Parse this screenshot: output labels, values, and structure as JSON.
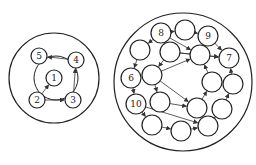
{
  "diagram": {
    "left_group": {
      "outer": {
        "cx": 54,
        "cy": 78,
        "r": 45
      },
      "ring": {
        "cx": 56,
        "cy": 78,
        "r": 22
      },
      "nodes": [
        {
          "id": "n5",
          "label": "5",
          "x": 39,
          "y": 56
        },
        {
          "id": "n4",
          "label": "4",
          "x": 76,
          "y": 60
        },
        {
          "id": "n1",
          "label": "1",
          "x": 54,
          "y": 78
        },
        {
          "id": "n2",
          "label": "2",
          "x": 37,
          "y": 100
        },
        {
          "id": "n3",
          "label": "3",
          "x": 73,
          "y": 100
        }
      ],
      "edges": [
        [
          "n4",
          "n5"
        ],
        [
          "n3",
          "n4"
        ],
        [
          "n2",
          "n3"
        ],
        [
          "n2",
          "n1"
        ]
      ]
    },
    "right_group": {
      "outer": {
        "cx": 183,
        "cy": 82,
        "r": 69
      },
      "nodes": [
        {
          "id": "r8",
          "label": "8",
          "x": 161,
          "y": 33
        },
        {
          "id": "rt",
          "label": "",
          "x": 185,
          "y": 30
        },
        {
          "id": "r9",
          "label": "9",
          "x": 208,
          "y": 36
        },
        {
          "id": "r7",
          "label": "7",
          "x": 229,
          "y": 58
        },
        {
          "id": "ra",
          "label": "",
          "x": 140,
          "y": 50
        },
        {
          "id": "rb",
          "label": "",
          "x": 170,
          "y": 52
        },
        {
          "id": "rc",
          "label": "",
          "x": 200,
          "y": 55
        },
        {
          "id": "r6",
          "label": "6",
          "x": 131,
          "y": 78
        },
        {
          "id": "rd",
          "label": "",
          "x": 152,
          "y": 75
        },
        {
          "id": "re",
          "label": "",
          "x": 212,
          "y": 82
        },
        {
          "id": "rf",
          "label": "",
          "x": 233,
          "y": 84
        },
        {
          "id": "r10",
          "label": "10",
          "x": 136,
          "y": 104
        },
        {
          "id": "rg",
          "label": "",
          "x": 160,
          "y": 102
        },
        {
          "id": "rh",
          "label": "",
          "x": 197,
          "y": 108
        },
        {
          "id": "ri",
          "label": "",
          "x": 222,
          "y": 109
        },
        {
          "id": "rj",
          "label": "",
          "x": 152,
          "y": 125
        },
        {
          "id": "rk",
          "label": "",
          "x": 181,
          "y": 131
        },
        {
          "id": "rl",
          "label": "",
          "x": 208,
          "y": 126
        }
      ],
      "edges": [
        [
          "r8",
          "rt"
        ],
        [
          "rt",
          "r9"
        ],
        [
          "r9",
          "r7"
        ],
        [
          "r8",
          "ra"
        ],
        [
          "ra",
          "r6"
        ],
        [
          "r6",
          "r10"
        ],
        [
          "r10",
          "rj"
        ],
        [
          "rj",
          "rk"
        ],
        [
          "rk",
          "rl"
        ],
        [
          "rl",
          "ri"
        ],
        [
          "ri",
          "rf"
        ],
        [
          "rf",
          "r7"
        ],
        [
          "r8",
          "rc"
        ],
        [
          "rb",
          "r7"
        ],
        [
          "rd",
          "rc"
        ],
        [
          "rd",
          "rg"
        ],
        [
          "rd",
          "rh"
        ],
        [
          "rb",
          "rd"
        ],
        [
          "rg",
          "rh"
        ],
        [
          "rh",
          "re"
        ],
        [
          "re",
          "rc"
        ],
        [
          "r10",
          "rl"
        ],
        [
          "rb",
          "r7"
        ]
      ]
    }
  }
}
